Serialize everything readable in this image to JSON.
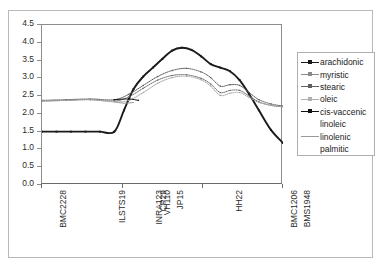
{
  "chart_data": {
    "type": "line",
    "title": "",
    "xlabel": "",
    "ylabel": "",
    "ylim": [
      0.0,
      4.5
    ],
    "ytick_labels": [
      "4.5",
      "4.0",
      "3.5",
      "3.0",
      "2.5",
      "2.0",
      "1.5",
      "1.0",
      "0.5",
      "0.0"
    ],
    "ytick_values": [
      4.5,
      4.0,
      3.5,
      3.0,
      2.5,
      2.0,
      1.5,
      1.0,
      0.5,
      0.0
    ],
    "grid": false,
    "legend_position": "right",
    "categories": [
      "BMC2228",
      "ILSTS19",
      "INRA123",
      "CP29",
      "VH110",
      "JP15",
      "HH22",
      "BMC1206",
      "BMS1948"
    ],
    "xtick_labels": [
      "BMC2228",
      "ILSTS19",
      "INRA123",
      "CP29",
      "VH110",
      "JP15",
      "HH22",
      "BMC1206",
      "BMS1948"
    ],
    "xtick_positions_px": [
      14,
      73,
      110,
      114,
      118,
      131,
      190,
      245,
      258
    ],
    "axis_tickmark_positions_px": [
      41,
      122,
      202,
      282
    ],
    "series": [
      {
        "name": "arachidonic",
        "color": "#1a1a1a",
        "style": "line-marker",
        "x": [
          0.0,
          0.06,
          0.12,
          0.18,
          0.24,
          0.3,
          0.34,
          0.38,
          0.42,
          0.46,
          0.5,
          0.54,
          0.58,
          0.62,
          0.66,
          0.7,
          0.74,
          0.78,
          0.82,
          0.86,
          0.9,
          0.95,
          1.0
        ],
        "values": [
          1.5,
          1.5,
          1.5,
          1.5,
          1.5,
          1.5,
          2.1,
          2.7,
          3.05,
          3.3,
          3.55,
          3.78,
          3.86,
          3.8,
          3.62,
          3.4,
          3.3,
          3.2,
          2.95,
          2.55,
          2.1,
          1.55,
          1.18
        ]
      },
      {
        "name": "myristic",
        "color": "#555555",
        "style": "line-marker",
        "x": [
          0.0,
          0.1,
          0.2,
          0.3,
          0.36,
          0.42,
          0.48,
          0.54,
          0.6,
          0.66,
          0.7,
          0.74,
          0.78,
          0.82,
          0.86,
          0.9,
          0.95,
          1.0
        ],
        "values": [
          2.38,
          2.4,
          2.42,
          2.4,
          2.55,
          2.8,
          3.05,
          3.22,
          3.28,
          3.18,
          3.02,
          2.78,
          2.82,
          2.8,
          2.6,
          2.4,
          2.28,
          2.22
        ]
      },
      {
        "name": "stearic",
        "color": "#6a6a6a",
        "style": "line-marker",
        "x": [
          0.0,
          0.1,
          0.2,
          0.3,
          0.36,
          0.42,
          0.48,
          0.54,
          0.6,
          0.66,
          0.7,
          0.74,
          0.78,
          0.82,
          0.86,
          0.9,
          0.95,
          1.0
        ],
        "values": [
          2.36,
          2.38,
          2.4,
          2.36,
          2.48,
          2.72,
          2.95,
          3.08,
          3.1,
          3.0,
          2.84,
          2.6,
          2.66,
          2.66,
          2.5,
          2.34,
          2.24,
          2.2
        ]
      },
      {
        "name": "oleic",
        "color": "#a5a5a5",
        "style": "line-marker",
        "x": [
          0.0,
          0.1,
          0.2,
          0.3,
          0.36,
          0.42,
          0.48,
          0.54,
          0.6,
          0.66,
          0.7,
          0.74,
          0.78,
          0.82,
          0.86,
          0.9,
          0.95,
          1.0
        ],
        "values": [
          2.36,
          2.38,
          2.4,
          2.34,
          2.38,
          2.6,
          2.86,
          3.02,
          3.06,
          2.96,
          2.78,
          2.52,
          2.58,
          2.6,
          2.46,
          2.32,
          2.24,
          2.2
        ]
      },
      {
        "name": "cis-vaccenic",
        "color": "#111111",
        "style": "line-marker",
        "x": [
          0.3,
          0.36,
          0.4
        ],
        "values": [
          2.4,
          2.42,
          2.38
        ]
      },
      {
        "name": "linoleic",
        "color": "#8c8c8c",
        "style": "none",
        "x": [],
        "values": []
      },
      {
        "name": "linolenic",
        "color": "#9a9a9a",
        "style": "line",
        "x": [
          0.3,
          0.34,
          0.38
        ],
        "values": [
          2.34,
          2.3,
          2.32
        ]
      },
      {
        "name": "palmitic",
        "color": "#8c8c8c",
        "style": "none",
        "x": [],
        "values": []
      }
    ]
  },
  "legend": {
    "items": [
      {
        "label": "arachidonic",
        "color": "#1a1a1a",
        "has_line": true,
        "has_marker": true
      },
      {
        "label": "myristic",
        "color": "#8a8a8a",
        "has_line": true,
        "has_marker": true
      },
      {
        "label": "stearic",
        "color": "#5f5f5f",
        "has_line": true,
        "has_marker": true
      },
      {
        "label": "oleic",
        "color": "#b0b0b0",
        "has_line": true,
        "has_marker": true
      },
      {
        "label": "cis-vaccenic",
        "color": "#111111",
        "has_line": true,
        "has_marker": true
      },
      {
        "label": "linoleic",
        "color": "#8c8c8c",
        "has_line": false,
        "has_marker": false
      },
      {
        "label": "linolenic",
        "color": "#9a9a9a",
        "has_line": true,
        "has_marker": false
      },
      {
        "label": "palmitic",
        "color": "#8c8c8c",
        "has_line": false,
        "has_marker": false
      }
    ]
  }
}
